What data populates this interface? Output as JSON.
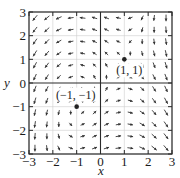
{
  "chart_data": {
    "type": "vector_field",
    "title": "",
    "xlabel": "x",
    "ylabel": "y",
    "xlim": [
      -3,
      3
    ],
    "ylim": [
      -3,
      3
    ],
    "grid": true,
    "field": {
      "P": "x - y",
      "Q": "1 - x^2"
    },
    "xticks": [
      "-3",
      "-2",
      "-1",
      "0",
      "1",
      "2",
      "3"
    ],
    "yticks": [
      "-3",
      "-2",
      "-1",
      "0",
      "1",
      "2",
      "3"
    ],
    "arrow_spacing": 0.5,
    "equilibrium_points": [
      {
        "x": 1,
        "y": 1,
        "label": "(1, 1)"
      },
      {
        "x": -1,
        "y": -1,
        "label": "(−1, −1)"
      }
    ]
  },
  "colors": {
    "arrow": "#333333",
    "grid": "#cfcfcf",
    "frame": "#2a2a2a",
    "point": "#222222"
  }
}
